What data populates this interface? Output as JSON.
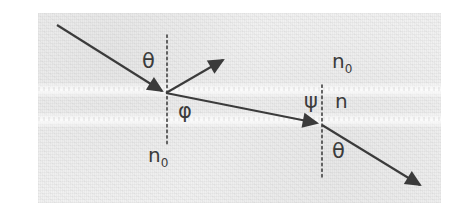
{
  "figure": {
    "kind": "optics-ray-diagram",
    "background_color": "#f1f1f1",
    "ink_color": "#3b3b3b",
    "plate": {
      "x": 38,
      "y": 13,
      "width": 403,
      "height": 190
    },
    "labels": [
      {
        "name": "theta-top",
        "text": "θ",
        "x": 104,
        "y": 38,
        "role": "angle-of-incidence"
      },
      {
        "name": "phi",
        "text": "φ",
        "x": 140,
        "y": 88,
        "role": "refraction-angle-in-slab"
      },
      {
        "name": "psi",
        "text": "ψ",
        "x": 266,
        "y": 78,
        "role": "angle-at-second-interface"
      },
      {
        "name": "n",
        "text": "n",
        "x": 297,
        "y": 78,
        "role": "slab-refractive-index"
      },
      {
        "name": "n0-top",
        "text": "n",
        "sub": "0",
        "x": 294,
        "y": 38,
        "role": "upper-medium-index"
      },
      {
        "name": "n0-bottom",
        "text": "n",
        "sub": "0",
        "x": 110,
        "y": 132,
        "role": "lower-medium-index"
      },
      {
        "name": "theta-bottom",
        "text": "θ",
        "x": 294,
        "y": 128,
        "role": "exit-angle"
      }
    ],
    "interfaces": [
      {
        "name": "upper-interface",
        "y": 77,
        "style": "faint-light-band"
      },
      {
        "name": "lower-interface",
        "y": 107,
        "style": "faint-light-band"
      }
    ],
    "normals": [
      {
        "name": "left-normal",
        "x": 129,
        "y1": 22,
        "y2": 132,
        "style": "dotted"
      },
      {
        "name": "right-normal",
        "x": 284,
        "y1": 72,
        "y2": 167,
        "style": "dotted"
      }
    ],
    "rays": [
      {
        "name": "incident-ray",
        "from": [
          19,
          12
        ],
        "to": [
          126,
          79
        ],
        "arrowhead": "end"
      },
      {
        "name": "reflected-ray",
        "from": [
          127,
          79
        ],
        "to": [
          187,
          45
        ],
        "arrowhead": "end"
      },
      {
        "name": "refracted-ray",
        "from": [
          127,
          80
        ],
        "to": [
          281,
          111
        ],
        "arrowhead": "end"
      },
      {
        "name": "exit-ray",
        "from": [
          284,
          112
        ],
        "to": [
          384,
          173
        ],
        "arrowhead": "end"
      }
    ],
    "vertices": [
      {
        "name": "upper-interface-vertex",
        "x": 127,
        "y": 79
      },
      {
        "name": "lower-interface-vertex",
        "x": 284,
        "y": 111
      }
    ]
  }
}
